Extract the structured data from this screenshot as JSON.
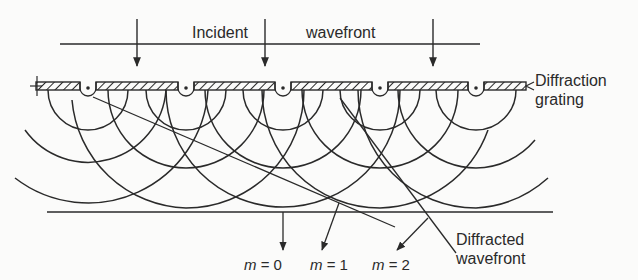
{
  "diagram": {
    "labels": {
      "incident": "Incident",
      "wavefront": "wavefront",
      "grating_line1": "Diffraction",
      "grating_line2": "grating",
      "diffracted_line1": "Diffracted",
      "diffracted_line2": "wavefront"
    },
    "orders": [
      {
        "var": "m",
        "eq": " = 0"
      },
      {
        "var": "m",
        "eq": " = 1"
      },
      {
        "var": "m",
        "eq": " = 2"
      }
    ],
    "colors": {
      "ink": "#2a2a2a",
      "background": "#fbfbfa"
    },
    "geometry": {
      "incident_line_y": 44,
      "grating_y": 86,
      "slit_x": [
        88,
        186,
        283,
        380,
        476
      ],
      "incident_arrow_x": [
        137,
        265,
        433
      ],
      "screen_line_y": 212
    }
  }
}
